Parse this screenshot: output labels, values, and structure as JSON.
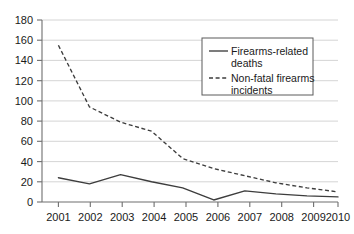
{
  "chart_data": {
    "type": "line",
    "title": "",
    "xlabel": "",
    "ylabel": "",
    "x": [
      2001,
      2002,
      2003,
      2004,
      2005,
      2006,
      2007,
      2008,
      2009,
      2010
    ],
    "categories": [
      "2001",
      "2002",
      "2003",
      "2004",
      "2005",
      "2006",
      "2007",
      "2008",
      "2009",
      "2010"
    ],
    "series": [
      {
        "name": "Firearms-related deaths",
        "style": "solid",
        "color": "#3d3d3d",
        "values": [
          24,
          18,
          27,
          20,
          14,
          2,
          11,
          8,
          6,
          5
        ]
      },
      {
        "name": "Non-fatal firearms incidents",
        "style": "dashed",
        "color": "#3d3d3d",
        "values": [
          155,
          94,
          79,
          70,
          43,
          33,
          26,
          19,
          14,
          10
        ]
      }
    ],
    "ylim": [
      0,
      180
    ],
    "y_ticks": [
      0,
      20,
      40,
      60,
      80,
      100,
      120,
      140,
      160,
      180
    ],
    "y_tick_labels": [
      "0",
      "20",
      "40",
      "60",
      "80",
      "100",
      "120",
      "140",
      "160",
      "180"
    ],
    "x_tick_labels": [
      "2001",
      "2002",
      "2003",
      "2004",
      "2005",
      "2006",
      "2007",
      "2008",
      "2009",
      "2010"
    ],
    "grid": true,
    "grid_axis": "y",
    "legend_position": "upper-right",
    "legend_entries": [
      {
        "label_line_1": "Firearms-related",
        "label_line_2": "deaths",
        "style": "solid"
      },
      {
        "label_line_1": "Non-fatal firearms",
        "label_line_2": "incidents",
        "style": "dashed"
      }
    ],
    "colors": {
      "grid": "#c9c9c9",
      "axis": "#6e6e6e",
      "text": "#1a1a1a",
      "background": "#ffffff"
    }
  }
}
